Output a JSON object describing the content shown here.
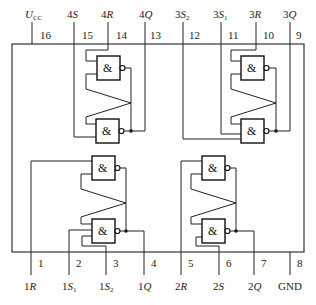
{
  "diagram": {
    "gate_symbol": "&",
    "top_pins": [
      {
        "num": "16",
        "label_main": "U",
        "label_sub": "CC",
        "label_pre": ""
      },
      {
        "num": "15",
        "label_pre": "4",
        "label_main": "S",
        "label_sub": ""
      },
      {
        "num": "14",
        "label_pre": "4",
        "label_main": "R",
        "label_sub": ""
      },
      {
        "num": "13",
        "label_pre": "4",
        "label_main": "Q",
        "label_sub": ""
      },
      {
        "num": "12",
        "label_pre": "3",
        "label_main": "S",
        "label_sub": "2"
      },
      {
        "num": "11",
        "label_pre": "3",
        "label_main": "S",
        "label_sub": "1"
      },
      {
        "num": "10",
        "label_pre": "3",
        "label_main": "R",
        "label_sub": ""
      },
      {
        "num": "9",
        "label_pre": "3",
        "label_main": "Q",
        "label_sub": ""
      }
    ],
    "bottom_pins": [
      {
        "num": "1",
        "label_pre": "1",
        "label_main": "R",
        "label_sub": ""
      },
      {
        "num": "2",
        "label_pre": "1",
        "label_main": "S",
        "label_sub": "1"
      },
      {
        "num": "3",
        "label_pre": "1",
        "label_main": "S",
        "label_sub": "2"
      },
      {
        "num": "4",
        "label_pre": "1",
        "label_main": "Q",
        "label_sub": ""
      },
      {
        "num": "5",
        "label_pre": "2",
        "label_main": "R",
        "label_sub": ""
      },
      {
        "num": "6",
        "label_pre": "2",
        "label_main": "S",
        "label_sub": ""
      },
      {
        "num": "7",
        "label_pre": "2",
        "label_main": "Q",
        "label_sub": ""
      },
      {
        "num": "8",
        "label_pre": "",
        "label_main": "GND",
        "label_sub": ""
      }
    ],
    "latches": [
      {
        "name": "latch-4",
        "position": "top-left"
      },
      {
        "name": "latch-3",
        "position": "top-right"
      },
      {
        "name": "latch-1",
        "position": "bottom-left"
      },
      {
        "name": "latch-2",
        "position": "bottom-right"
      }
    ]
  }
}
